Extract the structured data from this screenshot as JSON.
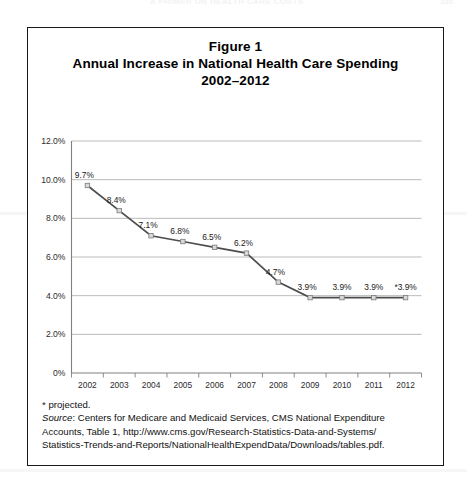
{
  "page_header": {
    "running_title": "A PRIMER ON HEALTH CARE COSTS",
    "page_number": "105"
  },
  "figure": {
    "title_line1": "Figure 1",
    "title_line2": "Annual Increase in National Health Care Spending",
    "title_line3": "2002–2012",
    "notes": {
      "projected_note": "* projected.",
      "source_label": "Source",
      "source_line1_rest": ": Centers for Medicare and Medicaid Services, CMS National Expenditure",
      "source_line2": "Accounts, Table 1, http://www.cms.gov/Research-Statistics-Data-and-Systems/",
      "source_line3": "Statistics-Trends-and-Reports/NationalHealthExpendData/Downloads/tables.pdf."
    }
  },
  "chart_data": {
    "type": "line",
    "title": "Annual Increase in National Health Care Spending 2002–2012",
    "xlabel": "",
    "ylabel": "",
    "categories": [
      "2002",
      "2003",
      "2004",
      "2005",
      "2006",
      "2007",
      "2008",
      "2009",
      "2010",
      "2011",
      "2012"
    ],
    "values": [
      9.7,
      8.4,
      7.1,
      6.8,
      6.5,
      6.2,
      4.7,
      3.9,
      3.9,
      3.9,
      3.9
    ],
    "point_labels": [
      "9.7%",
      "8.4%",
      "7.1%",
      "6.8%",
      "6.5%",
      "6.2%",
      "4.7%",
      "3.9%",
      "3.9%",
      "3.9%",
      "*3.9%"
    ],
    "ylim": [
      0,
      12
    ],
    "ytick_values": [
      0,
      2,
      4,
      6,
      8,
      10,
      12
    ],
    "ytick_labels": [
      "0%",
      "2.0%",
      "4.0%",
      "6.0%",
      "8.0%",
      "10.0%",
      "12.0%"
    ],
    "grid": "horizontal",
    "legend": "none",
    "series_color": "#4d4d4d",
    "marker_color": "#d9d9d9",
    "marker_edge_color": "#808080",
    "gridline_color": "#b3b3b3",
    "axis_color": "#808080",
    "annotations": [
      "* projected."
    ]
  }
}
